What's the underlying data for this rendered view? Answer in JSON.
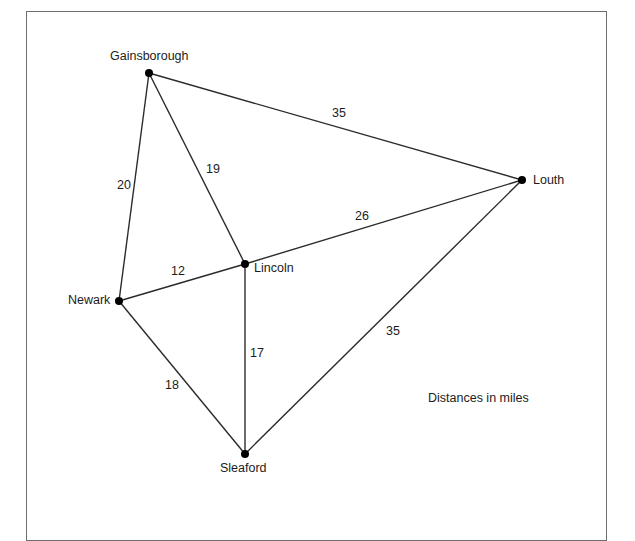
{
  "figure": {
    "caption": "Distances in miles",
    "caption_position": {
      "x": 428,
      "y": 392
    },
    "border_color": "#6f6f6f",
    "background_color": "#ffffff",
    "line_color": "#2b2b2b",
    "node_color": "#000000",
    "text_color": "#1c1c1c"
  },
  "nodes": [
    {
      "id": "gainsborough",
      "label": "Gainsborough",
      "x": 149,
      "y": 73,
      "label_x": 110,
      "label_y": 50
    },
    {
      "id": "louth",
      "label": "Louth",
      "x": 522,
      "y": 180,
      "label_x": 533,
      "label_y": 174
    },
    {
      "id": "lincoln",
      "label": "Lincoln",
      "x": 245,
      "y": 264,
      "label_x": 254,
      "label_y": 262
    },
    {
      "id": "newark",
      "label": "Newark",
      "x": 119,
      "y": 301,
      "label_x": 68,
      "label_y": 294
    },
    {
      "id": "sleaford",
      "label": "Sleaford",
      "x": 245,
      "y": 454,
      "label_x": 220,
      "label_y": 462
    }
  ],
  "edges": [
    {
      "id": "gainsborough-louth",
      "from": "gainsborough",
      "to": "louth",
      "weight": "35",
      "label_x": 332,
      "label_y": 107
    },
    {
      "id": "gainsborough-newark",
      "from": "gainsborough",
      "to": "newark",
      "weight": "20",
      "label_x": 117,
      "label_y": 179
    },
    {
      "id": "gainsborough-lincoln",
      "from": "gainsborough",
      "to": "lincoln",
      "weight": "19",
      "label_x": 206,
      "label_y": 163
    },
    {
      "id": "lincoln-louth",
      "from": "lincoln",
      "to": "louth",
      "weight": "26",
      "label_x": 355,
      "label_y": 210
    },
    {
      "id": "newark-lincoln",
      "from": "newark",
      "to": "lincoln",
      "weight": "12",
      "label_x": 171,
      "label_y": 265
    },
    {
      "id": "lincoln-sleaford",
      "from": "lincoln",
      "to": "sleaford",
      "weight": "17",
      "label_x": 250,
      "label_y": 347
    },
    {
      "id": "newark-sleaford",
      "from": "newark",
      "to": "sleaford",
      "weight": "18",
      "label_x": 165,
      "label_y": 379
    },
    {
      "id": "sleaford-louth",
      "from": "sleaford",
      "to": "louth",
      "weight": "35",
      "label_x": 386,
      "label_y": 325
    }
  ]
}
